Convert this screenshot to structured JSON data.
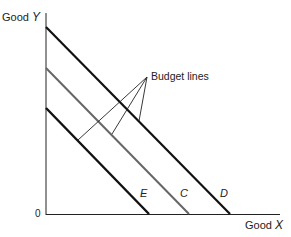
{
  "diagram": {
    "title": "",
    "y_axis_label": "Good",
    "y_axis_var": "Y",
    "x_axis_label": "Good",
    "x_axis_var": "X",
    "origin_label": "0",
    "annotation": "Budget lines",
    "lines": [
      {
        "name": "D",
        "color": "#111111"
      },
      {
        "name": "C",
        "color": "#666666"
      },
      {
        "name": "E",
        "color": "#111111"
      }
    ]
  }
}
